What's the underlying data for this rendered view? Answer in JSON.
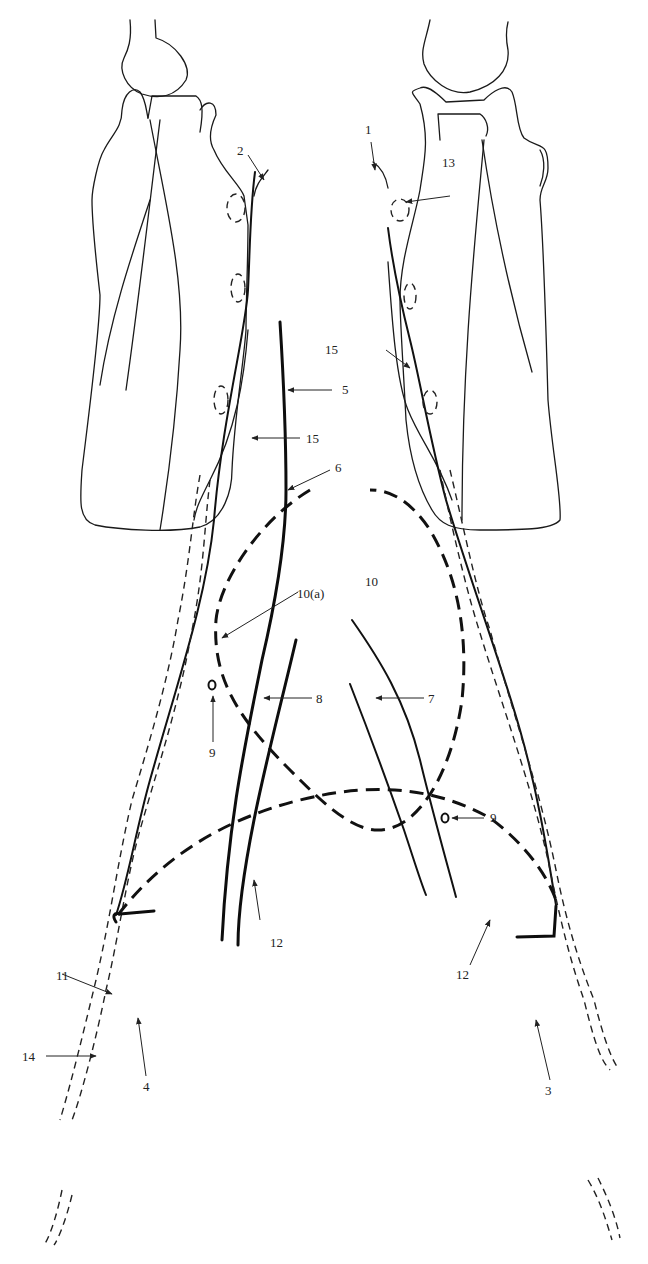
{
  "diagram": {
    "title": "",
    "labels": {
      "l1": "1",
      "l2": "2",
      "l3": "3",
      "l4": "4",
      "l5": "5",
      "l6": "6",
      "l7": "7",
      "l8": "8",
      "l9a": "9",
      "l9b": "9",
      "l10": "10",
      "l10a": "10(a)",
      "l11": "11",
      "l12a": "12",
      "l12b": "12",
      "l13": "13",
      "l14": "14",
      "l15a": "15",
      "l15b": "15"
    },
    "colors": {
      "ink": "#111111",
      "background": "#ffffff"
    }
  }
}
